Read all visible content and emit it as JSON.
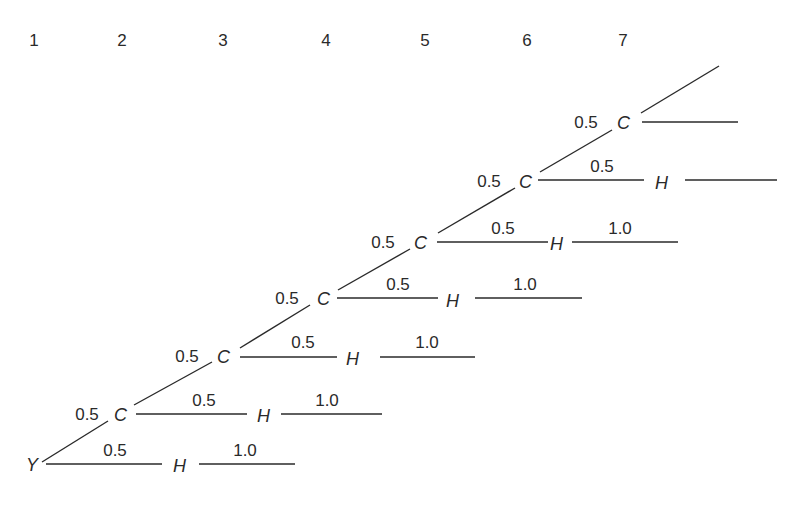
{
  "columns": [
    "1",
    "2",
    "3",
    "4",
    "5",
    "6",
    "7"
  ],
  "root": "Y",
  "backbone_node": "C",
  "branch_node": "H",
  "rows": [
    {
      "start": "Y",
      "side_weight": "0.5",
      "side_node": "H",
      "tail_weight": "1.0"
    },
    {
      "in_weight": "0.5",
      "node": "C",
      "side_weight": "0.5",
      "side_node": "H",
      "tail_weight": "1.0"
    },
    {
      "in_weight": "0.5",
      "node": "C",
      "side_weight": "0.5",
      "side_node": "H",
      "tail_weight": "1.0"
    },
    {
      "in_weight": "0.5",
      "node": "C",
      "side_weight": "0.5",
      "side_node": "H",
      "tail_weight": "1.0"
    },
    {
      "in_weight": "0.5",
      "node": "C",
      "side_weight": "0.5",
      "side_node": "H",
      "tail_weight": "1.0"
    },
    {
      "in_weight": "0.5",
      "node": "C",
      "side_weight": "0.5",
      "side_node": "H",
      "tail_weight": ""
    },
    {
      "in_weight": "0.5",
      "node": "C",
      "side_weight": "",
      "side_node": "",
      "tail_weight": ""
    }
  ]
}
